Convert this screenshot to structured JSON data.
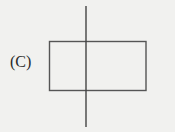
{
  "figure": {
    "label": "(C)",
    "shapes": {
      "rectangle": {
        "x": 49.5,
        "y": 41.5,
        "width": 96.5,
        "height": 49
      },
      "vertical_line": {
        "x": 86,
        "y1": 6,
        "y2": 127
      }
    },
    "colors": {
      "background": "#f1f1ef",
      "stroke": "#555555",
      "text": "#2a2a2a"
    }
  }
}
